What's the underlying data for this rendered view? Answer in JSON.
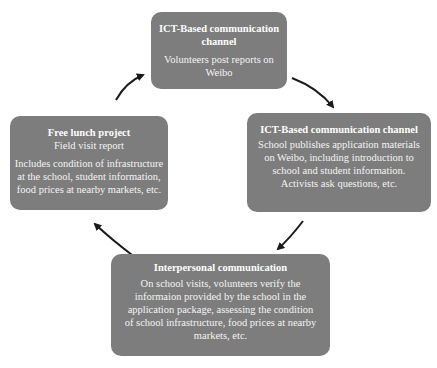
{
  "diagram": {
    "type": "cycle",
    "colors": {
      "box_fill": "#7d7d7d",
      "box_text": "#f4f4f4",
      "arrow": "#1a1a1a",
      "background": "#ffffff"
    },
    "nodes": [
      {
        "id": "top",
        "title": "ICT-Based communication channel",
        "body": [
          "Volunteers post reports on Weibo"
        ]
      },
      {
        "id": "right",
        "title": "ICT-Based communication channel",
        "body": [
          "School publishes application materials on Weibo, including introduction to school and student information.",
          "Activists ask questions, etc."
        ]
      },
      {
        "id": "bottom",
        "title": "Interpersonal communication",
        "body": [
          "On school visits, volunteers verify the informaion provided by the school in the application package, assessing the condition of school infrastructure, food prices at nearby markets, etc."
        ]
      },
      {
        "id": "left",
        "title": "Free lunch project",
        "subtitle": "Field visit report",
        "body": [
          "Includes condition of infrastructure at the school, student information, food prices at nearby markets, etc."
        ]
      }
    ],
    "edges": [
      {
        "from": "top",
        "to": "right"
      },
      {
        "from": "right",
        "to": "bottom"
      },
      {
        "from": "bottom",
        "to": "left"
      },
      {
        "from": "left",
        "to": "top"
      }
    ]
  }
}
